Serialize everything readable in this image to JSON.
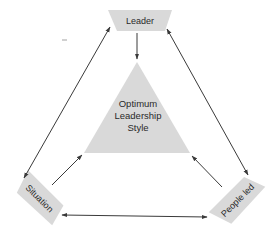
{
  "diagram": {
    "type": "leadership-triangle",
    "nodes": {
      "leader": {
        "label": "Leader"
      },
      "situation": {
        "label": "Situation"
      },
      "people_led": {
        "label": "People led"
      },
      "center": {
        "lines": [
          "Optimum",
          "Leadership",
          "Style"
        ]
      }
    },
    "edges": [
      {
        "from": "leader",
        "to": "center",
        "direction": "one-way"
      },
      {
        "from": "situation",
        "to": "center",
        "direction": "one-way"
      },
      {
        "from": "people_led",
        "to": "center",
        "direction": "one-way"
      },
      {
        "from": "leader",
        "to": "situation",
        "direction": "two-way"
      },
      {
        "from": "leader",
        "to": "people_led",
        "direction": "two-way"
      },
      {
        "from": "situation",
        "to": "people_led",
        "direction": "two-way"
      }
    ],
    "colors": {
      "shape_fill": "#d9d9d9",
      "line": "#3a3a3a",
      "text": "#2a2a2a",
      "background": "#ffffff"
    }
  }
}
